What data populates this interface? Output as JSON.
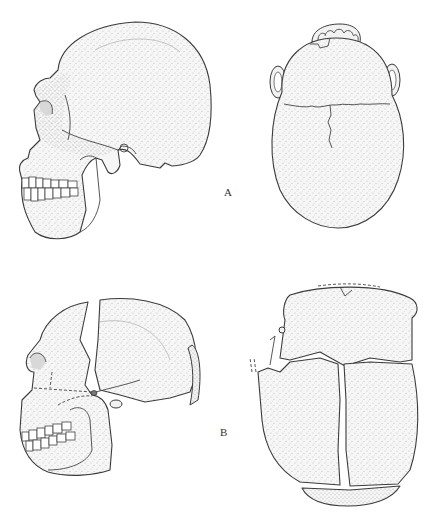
{
  "figure": {
    "type": "anatomical illustration",
    "panels": [
      {
        "label": "A",
        "views": [
          "lateral view of skull",
          "superior view of skull"
        ]
      },
      {
        "label": "B",
        "views": [
          "lateral view of skull with separated cranial bones",
          "superior view of skull with separated cranial bones"
        ]
      }
    ],
    "colors": {
      "ink": "#3a3a3a",
      "stipple": "#9a9a9a",
      "background": "#ffffff"
    }
  }
}
